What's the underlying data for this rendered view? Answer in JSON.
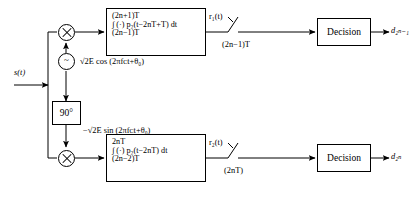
{
  "diagram": {
    "input": {
      "label": "s(t)"
    },
    "oscillator": {
      "symbol": "~",
      "name": "local-oscillator"
    },
    "phase_shifter": {
      "label": "90°"
    },
    "carriers": {
      "inphase": "√2E cos (2πfᴄt+θ₀)",
      "quadrature": "−√2E sin (2πfᴄt+θ₀)"
    },
    "branches": [
      {
        "name": "upper",
        "integrator": {
          "upper_limit": "(2n+1)T",
          "integrand": "∫ (·) p₂(t−2nT+T) dt",
          "lower_limit": "(2n−1)T"
        },
        "output_signal": "r₁(t)",
        "sample_time": "(2n−1)T",
        "decision_label": "Decision",
        "decision_output": "d₂ₙ₋₁"
      },
      {
        "name": "lower",
        "integrator": {
          "upper_limit": "2nT",
          "integrand": "∫ (·) p₂(t−2nT) dt",
          "lower_limit": "(2n−2)T"
        },
        "output_signal": "r₂(t)",
        "sample_time": "(2nT)",
        "decision_label": "Decision",
        "decision_output": "d₂ₙ"
      }
    ],
    "colors": {
      "line": "#000000",
      "background": "#ffffff"
    }
  }
}
